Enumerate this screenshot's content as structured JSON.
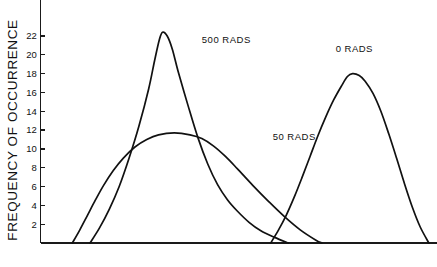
{
  "chart_data": {
    "type": "line",
    "title": "",
    "xlabel": "",
    "ylabel": "FREQUENCY OF OCCURRENCE",
    "ylim": [
      0,
      23.5
    ],
    "xlim": [
      0,
      100
    ],
    "grid": false,
    "legend_position": "inline-annotations",
    "ytick_labels": [
      "2",
      "4",
      "6",
      "8",
      "10",
      "12",
      "14",
      "16",
      "18",
      "20",
      "22"
    ],
    "ytick_values": [
      2,
      4,
      6,
      8,
      10,
      12,
      14,
      16,
      18,
      20,
      22
    ],
    "xtick_labels": [],
    "xtick_values": [],
    "series": [
      {
        "name": "500 RADS",
        "label": "500 RADS",
        "peak_value": 22.4,
        "peak_x": 31.0,
        "x_start": 12.6,
        "x_end": 63.0,
        "points": [
          [
            12.6,
            0.0
          ],
          [
            15.0,
            1.6
          ],
          [
            17.5,
            3.6
          ],
          [
            20.0,
            6.0
          ],
          [
            22.5,
            9.0
          ],
          [
            25.0,
            12.4
          ],
          [
            27.5,
            16.4
          ],
          [
            29.0,
            19.4
          ],
          [
            30.2,
            21.6
          ],
          [
            31.0,
            22.4
          ],
          [
            32.2,
            22.0
          ],
          [
            33.5,
            20.6
          ],
          [
            35.0,
            18.2
          ],
          [
            37.5,
            14.6
          ],
          [
            40.0,
            11.2
          ],
          [
            42.5,
            8.4
          ],
          [
            45.0,
            6.2
          ],
          [
            47.5,
            4.6
          ],
          [
            50.0,
            3.4
          ],
          [
            53.0,
            2.2
          ],
          [
            56.0,
            1.3
          ],
          [
            59.5,
            0.6
          ],
          [
            63.0,
            0.0
          ]
        ]
      },
      {
        "name": "50 RADS",
        "label": "50 RADS",
        "peak_value": 11.7,
        "peak_x": 34.0,
        "x_start": 8.1,
        "x_end": 52.4,
        "points": [
          [
            8.1,
            0.0
          ],
          [
            10.0,
            1.4
          ],
          [
            12.0,
            3.0
          ],
          [
            14.0,
            4.6
          ],
          [
            16.0,
            6.1
          ],
          [
            18.5,
            7.7
          ],
          [
            21.0,
            9.0
          ],
          [
            24.0,
            10.2
          ],
          [
            27.0,
            11.0
          ],
          [
            30.0,
            11.5
          ],
          [
            34.0,
            11.7
          ],
          [
            38.0,
            11.5
          ],
          [
            41.0,
            11.1
          ],
          [
            44.0,
            10.3
          ],
          [
            47.0,
            9.2
          ],
          [
            50.0,
            7.9
          ],
          [
            54.0,
            6.1
          ],
          [
            58.0,
            4.4
          ],
          [
            62.0,
            2.8
          ],
          [
            66.0,
            1.4
          ],
          [
            70.0,
            0.3
          ],
          [
            71.5,
            0.0
          ]
        ]
      },
      {
        "name": "0 RADS",
        "label": "0 RADS",
        "peak_value": 18.0,
        "peak_x": 79.3,
        "x_start": 58.5,
        "x_end": 98.7,
        "points": [
          [
            58.5,
            0.0
          ],
          [
            60.5,
            1.4
          ],
          [
            62.5,
            3.0
          ],
          [
            64.5,
            4.9
          ],
          [
            66.5,
            7.0
          ],
          [
            68.5,
            9.2
          ],
          [
            70.5,
            11.4
          ],
          [
            72.5,
            13.4
          ],
          [
            74.5,
            15.2
          ],
          [
            76.5,
            16.7
          ],
          [
            78.0,
            17.7
          ],
          [
            79.3,
            18.0
          ],
          [
            81.0,
            17.8
          ],
          [
            82.5,
            17.2
          ],
          [
            84.5,
            15.9
          ],
          [
            86.5,
            14.0
          ],
          [
            88.5,
            11.6
          ],
          [
            90.5,
            9.0
          ],
          [
            92.5,
            6.3
          ],
          [
            94.5,
            3.8
          ],
          [
            96.5,
            1.7
          ],
          [
            98.7,
            0.0
          ]
        ]
      }
    ],
    "annotations": [
      {
        "text": "500 RADS",
        "x": 41.0,
        "y": 21.3
      },
      {
        "text": "50 RADS",
        "x": 59.0,
        "y": 11.0
      },
      {
        "text": "0 RADS",
        "x": 75.0,
        "y": 20.3
      }
    ]
  },
  "colors": {
    "curve": "#111111",
    "axis": "#1a1a1a",
    "background": "#ffffff",
    "text": "#111111"
  }
}
